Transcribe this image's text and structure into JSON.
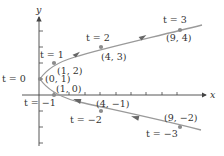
{
  "diagram": {
    "type": "parametric-curve",
    "equations": {
      "x": "t^2",
      "y": "t + 1"
    },
    "axes": {
      "x_label": "x",
      "y_label": "y",
      "x_ticks": [
        1,
        2,
        3,
        4,
        5,
        6,
        7,
        8,
        9
      ],
      "y_ticks": [
        -3,
        -2,
        -1,
        1,
        2,
        3,
        4
      ]
    },
    "colors": {
      "curve": "#9a9a9a",
      "points": "#8c8c8c",
      "axis": "#444444",
      "text": "#333333"
    },
    "points": [
      {
        "t": -3,
        "t_label": "t = −3",
        "coord": "(9, −2)",
        "x": 9,
        "y": -2
      },
      {
        "t": -2,
        "t_label": "t = −2",
        "coord": "(4, −1)",
        "x": 4,
        "y": -1
      },
      {
        "t": -1,
        "t_label": "t = −1",
        "coord": "(1, 0)",
        "x": 1,
        "y": 0
      },
      {
        "t": 0,
        "t_label": "t = 0",
        "coord": "(0, 1)",
        "x": 0,
        "y": 1
      },
      {
        "t": 1,
        "t_label": "t = 1",
        "coord": "(1, 2)",
        "x": 1,
        "y": 2
      },
      {
        "t": 2,
        "t_label": "t = 2",
        "coord": "(4, 3)",
        "x": 4,
        "y": 3
      },
      {
        "t": 3,
        "t_label": "t = 3",
        "coord": "(9, 4)",
        "x": 9,
        "y": 4
      }
    ],
    "direction": "increasing t moves upward along the parabola"
  }
}
